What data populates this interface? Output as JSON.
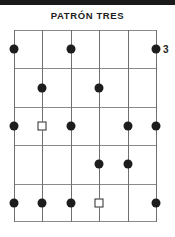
{
  "page": {
    "title": "PATRÓN TRES",
    "top_strip_color": "#1a1a1a",
    "background_color": "#ffffff"
  },
  "position_label": "3",
  "chart_data": {
    "type": "table",
    "title": "PATRÓN TRES",
    "subtitle": "",
    "xlabel": "",
    "ylabel": "",
    "grid": true,
    "legend_position": "none",
    "columns": 6,
    "rows": 5,
    "column_labels": [
      "1",
      "2",
      "3",
      "4",
      "5",
      "6"
    ],
    "row_labels": [
      "1",
      "2",
      "3",
      "4",
      "5"
    ],
    "position_marker": "3",
    "marker_colors": {
      "filled": "#1d1d1d",
      "open_outline": "#2a2a2a",
      "open_fill": "#ffffff",
      "grid_line": "#8a8a8a",
      "string_line": "#6f6f6f"
    },
    "markers": [
      {
        "row": 1,
        "col": 1,
        "shape": "dot"
      },
      {
        "row": 1,
        "col": 3,
        "shape": "dot"
      },
      {
        "row": 1,
        "col": 6,
        "shape": "dot"
      },
      {
        "row": 2,
        "col": 2,
        "shape": "dot"
      },
      {
        "row": 2,
        "col": 4,
        "shape": "dot"
      },
      {
        "row": 3,
        "col": 1,
        "shape": "dot"
      },
      {
        "row": 3,
        "col": 2,
        "shape": "square"
      },
      {
        "row": 3,
        "col": 3,
        "shape": "dot"
      },
      {
        "row": 3,
        "col": 5,
        "shape": "dot"
      },
      {
        "row": 3,
        "col": 6,
        "shape": "dot"
      },
      {
        "row": 4,
        "col": 4,
        "shape": "dot"
      },
      {
        "row": 4,
        "col": 5,
        "shape": "dot"
      },
      {
        "row": 5,
        "col": 1,
        "shape": "dot"
      },
      {
        "row": 5,
        "col": 2,
        "shape": "dot"
      },
      {
        "row": 5,
        "col": 3,
        "shape": "dot"
      },
      {
        "row": 5,
        "col": 4,
        "shape": "square"
      },
      {
        "row": 5,
        "col": 6,
        "shape": "dot"
      }
    ]
  }
}
